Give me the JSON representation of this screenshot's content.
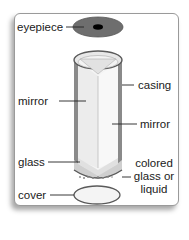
{
  "diagram": {
    "labels": {
      "eyepiece": "eyepiece",
      "casing": "casing",
      "mirror_left": "mirror",
      "mirror_right": "mirror",
      "glass": "glass",
      "colored_line1": "colored",
      "colored_line2": "glass or",
      "colored_line3": "liquid",
      "cover": "cover"
    },
    "colors": {
      "eyepiece_disc": "#6e6e6e",
      "eyepiece_hole": "#000000",
      "casing_edge": "#5a5a5a",
      "mirror_fill": "#f2f2f2",
      "card_border": "#9a9a9a"
    }
  }
}
